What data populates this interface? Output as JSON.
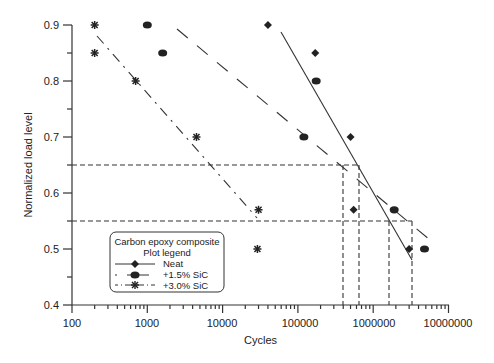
{
  "chart_data": {
    "type": "scatter",
    "title": "",
    "xlabel": "Cycles",
    "ylabel": "Normalized load level",
    "xscale": "log",
    "xlim": [
      100,
      10000000
    ],
    "ylim": [
      0.4,
      0.9
    ],
    "x_ticks": [
      "100",
      "1000",
      "10000",
      "100000",
      "1000000",
      "10000000"
    ],
    "y_ticks": [
      "0.4",
      "0.5",
      "0.6",
      "0.7",
      "0.8",
      "0.9"
    ],
    "grid": false,
    "legend": {
      "title_line1": "Carbon epoxy composite",
      "title_line2": "Plot legend",
      "position": "lower-left",
      "entries": [
        "Neat",
        "+1.5% SiC",
        "+3.0% SiC"
      ]
    },
    "series": [
      {
        "name": "Neat",
        "marker": "diamond",
        "line": "solid",
        "points": [
          [
            40000,
            0.9
          ],
          [
            170000,
            0.85
          ],
          [
            500000,
            0.7
          ],
          [
            550000,
            0.57
          ],
          [
            3000000,
            0.5
          ]
        ],
        "fit": [
          [
            60000,
            0.88
          ],
          [
            3000000,
            0.48
          ]
        ]
      },
      {
        "name": "+1.5% SiC",
        "marker": "circle",
        "line": "dashed",
        "points": [
          [
            1000,
            0.9
          ],
          [
            1600,
            0.85
          ],
          [
            175000,
            0.8
          ],
          [
            120000,
            0.7
          ],
          [
            1900000,
            0.57
          ],
          [
            4800000,
            0.5
          ]
        ],
        "fit": [
          [
            8000,
            0.88
          ],
          [
            8000000,
            0.51
          ]
        ]
      },
      {
        "name": "+3.0% SiC",
        "marker": "star",
        "line": "dash-dot",
        "points": [
          [
            200,
            0.9
          ],
          [
            200,
            0.85
          ],
          [
            700,
            0.8
          ],
          [
            4500,
            0.7
          ],
          [
            30000,
            0.57
          ],
          [
            29000,
            0.5
          ]
        ],
        "fit": [
          [
            220,
            0.88
          ],
          [
            30000,
            0.55
          ]
        ]
      }
    ],
    "annotations": {
      "reference_levels": [
        0.65,
        0.55
      ],
      "reference_cycles_at_0_65": [
        400000,
        620000
      ],
      "reference_cycles_at_0_55": [
        1600000,
        3200000
      ]
    }
  }
}
